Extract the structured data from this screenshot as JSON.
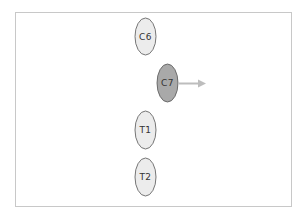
{
  "diagram": {
    "type": "spine-vertebrae-displacement",
    "colors": {
      "frame_border": "#c8c8c8",
      "normal_fill": "#ececec",
      "highlight_fill": "#a9a9a9",
      "outline": "#555555",
      "arrow": "#bdbdbd",
      "label": "#333333"
    },
    "vertebrae": [
      {
        "label": "C6",
        "cx": 145.5,
        "cy": 36.5,
        "rx": 10.5,
        "ry": 18.5,
        "highlighted": false
      },
      {
        "label": "C7",
        "cx": 167.5,
        "cy": 83,
        "rx": 10.5,
        "ry": 19,
        "highlighted": true
      },
      {
        "label": "T1",
        "cx": 145.5,
        "cy": 130,
        "rx": 10.5,
        "ry": 19,
        "highlighted": false
      },
      {
        "label": "T2",
        "cx": 145.5,
        "cy": 177,
        "rx": 10.5,
        "ry": 19,
        "highlighted": false
      }
    ],
    "arrow": {
      "from_label": "C7",
      "direction": "right",
      "x1": 179,
      "y1": 83.5,
      "x2": 206,
      "y2": 83.5
    }
  }
}
